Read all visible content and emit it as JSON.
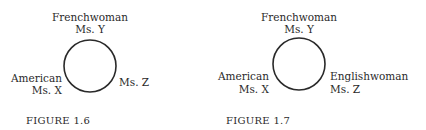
{
  "figures": [
    {
      "caption": "FIGURE 1.6",
      "top": {
        "line1": "Frenchwoman",
        "line2": "Ms. Y"
      },
      "left": {
        "line1": "American",
        "line2": "Ms. X"
      },
      "right": {
        "line1": "",
        "line2": "Ms. Z"
      }
    },
    {
      "caption": "FIGURE 1.7",
      "top": {
        "line1": "Frenchwoman",
        "line2": "Ms. Y"
      },
      "left": {
        "line1": "American",
        "line2": "Ms. X"
      },
      "right": {
        "line1": "Englishwoman",
        "line2": "Ms. Z"
      }
    }
  ]
}
